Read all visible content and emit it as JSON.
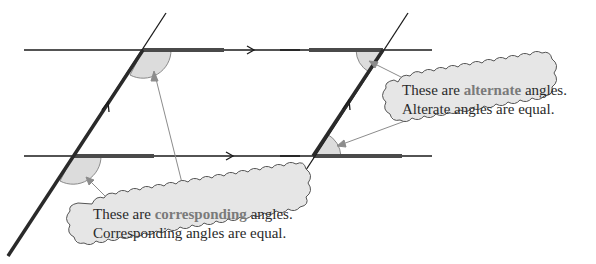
{
  "diagram": {
    "colors": {
      "line": "#1a1a1a",
      "highlight_line": "#4a4a4a",
      "angle_fill": "#dcdcdc",
      "angle_stroke": "#8a8a8a",
      "pointer": "#8c8c8c",
      "bubble_fill": "#e6e6e6",
      "bubble_stroke": "#555555",
      "emphasis_text": "#7a7a7a"
    },
    "left_figure": {
      "label": "corresponding angles figure",
      "parallel_lines": 2,
      "transversal": 1
    },
    "right_figure": {
      "label": "alternate angles figure (Z shape)",
      "parallel_lines": 2,
      "transversal": 1
    },
    "corresponding_bubble": {
      "line1_prefix": "These are ",
      "line1_emphasis": "corresponding",
      "line1_suffix": " angles.",
      "line2": "Corresponding angles are equal."
    },
    "alternate_bubble": {
      "line1_prefix": "These are ",
      "line1_emphasis": "alternate",
      "line1_suffix": " angles.",
      "line2": "Alterate angles are equal."
    }
  }
}
